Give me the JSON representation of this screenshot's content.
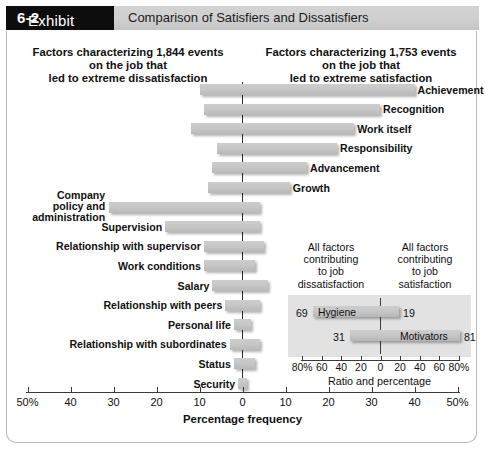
{
  "header": {
    "exhibit_prefix": "Exhibit ",
    "exhibit_number": "6-2",
    "title": "Comparison of Satisfiers and Dissatisfiers"
  },
  "headings": {
    "left": "Factors characterizing 1,844 events\non the job that\nled to extreme dissatisfaction",
    "right": "Factors characterizing 1,753 events\non the job that\nled to extreme satisfaction"
  },
  "axis": {
    "title": "Percentage frequency",
    "ticks": [
      "50%",
      "40",
      "30",
      "20",
      "10",
      "0",
      "10",
      "20",
      "30",
      "40",
      "50%"
    ],
    "range_left": 50,
    "range_right": 50
  },
  "inset": {
    "caption_left": "All factors\ncontributing\nto job\ndissatisfaction",
    "caption_right": "All factors\ncontributing\nto job\nsatisfaction",
    "title": "Ratio and percentage",
    "ticks": [
      "80%",
      "60",
      "40",
      "20",
      "0",
      "20",
      "40",
      "60",
      "80%"
    ],
    "rows": [
      {
        "name": "Hygiene",
        "left_value": "69",
        "right_value": "19"
      },
      {
        "name": "Motivators",
        "left_value": "31",
        "right_value": "81"
      }
    ]
  },
  "colors": {
    "bar_fill": "#c6c6c6",
    "inset_bg": "#e2e2e2",
    "header_black": "#0d0d0d",
    "header_gray": "#cfcfcf",
    "axis": "#3a3a3a"
  },
  "chart_data": {
    "type": "bar",
    "title": "Comparison of Satisfiers and Dissatisfiers",
    "subtitle": "Herzberg two-factor theory: factors characterizing events on the job",
    "xlabel": "Percentage frequency",
    "ylabel": "",
    "xlim": [
      -50,
      50
    ],
    "grid": false,
    "legend": "none",
    "orientation": "horizontal",
    "note": "Each factor bar spans from a dissatisfaction percentage (left of zero, negative) to a satisfaction percentage (right of zero, positive).",
    "categories": [
      "Achievement",
      "Recognition",
      "Work itself",
      "Responsibility",
      "Advancement",
      "Growth",
      "Company policy and administration",
      "Supervision",
      "Relationship with supervisor",
      "Work conditions",
      "Salary",
      "Relationship with peers",
      "Personal life",
      "Relationship with subordinates",
      "Status",
      "Security"
    ],
    "series": [
      {
        "name": "Dissatisfaction (% of events, left of zero)",
        "values": [
          10,
          9,
          12,
          6,
          7,
          8,
          31,
          18,
          9,
          9,
          7,
          4,
          2,
          3,
          2,
          1
        ]
      },
      {
        "name": "Satisfaction (% of events, right of zero)",
        "values": [
          40,
          32,
          26,
          22,
          15,
          11,
          4,
          4,
          5,
          3,
          6,
          4,
          2,
          4,
          3,
          1
        ]
      }
    ],
    "labels_side": [
      "right",
      "right",
      "right",
      "right",
      "right",
      "right",
      "left",
      "left",
      "left",
      "left",
      "left",
      "left",
      "left",
      "left",
      "left",
      "left"
    ]
  },
  "bars": [
    {
      "label": "Achievement",
      "left_pct": 10,
      "right_pct": 40,
      "side": "right"
    },
    {
      "label": "Recognition",
      "left_pct": 9,
      "right_pct": 32,
      "side": "right"
    },
    {
      "label": "Work itself",
      "left_pct": 12,
      "right_pct": 26,
      "side": "right"
    },
    {
      "label": "Responsibility",
      "left_pct": 6,
      "right_pct": 22,
      "side": "right"
    },
    {
      "label": "Advancement",
      "left_pct": 7,
      "right_pct": 15,
      "side": "right"
    },
    {
      "label": "Growth",
      "left_pct": 8,
      "right_pct": 11,
      "side": "right"
    },
    {
      "label": "Company policy and administration",
      "left_pct": 31,
      "right_pct": 4,
      "side": "left"
    },
    {
      "label": "Supervision",
      "left_pct": 18,
      "right_pct": 4,
      "side": "left"
    },
    {
      "label": "Relationship with supervisor",
      "left_pct": 9,
      "right_pct": 5,
      "side": "left"
    },
    {
      "label": "Work conditions",
      "left_pct": 9,
      "right_pct": 3,
      "side": "left"
    },
    {
      "label": "Salary",
      "left_pct": 7,
      "right_pct": 6,
      "side": "left"
    },
    {
      "label": "Relationship with peers",
      "left_pct": 4,
      "right_pct": 4,
      "side": "left"
    },
    {
      "label": "Personal life",
      "left_pct": 2,
      "right_pct": 2,
      "side": "left"
    },
    {
      "label": "Relationship with subordinates",
      "left_pct": 3,
      "right_pct": 4,
      "side": "left"
    },
    {
      "label": "Status",
      "left_pct": 2,
      "right_pct": 3,
      "side": "left"
    },
    {
      "label": "Security",
      "left_pct": 1,
      "right_pct": 1,
      "side": "left"
    }
  ]
}
